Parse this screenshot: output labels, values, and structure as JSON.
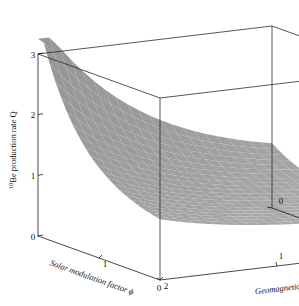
{
  "figure": {
    "type": "3d-surface-plot",
    "background_color": "#ffffff",
    "width": 299,
    "height": 306
  },
  "chart_data": {
    "type": "surface",
    "title": "",
    "projection": "3d",
    "zlabel_parts": {
      "superscript": "10",
      "text": "Be production rate Q"
    },
    "zlabel": "10Be production rate Q",
    "xlabel": "Solar modulation factor ϕ",
    "ylabel": "Geomagnetic field M",
    "xlim": [
      0,
      2
    ],
    "ylim": [
      0,
      2
    ],
    "zlim": [
      0,
      3
    ],
    "xticks": [
      0,
      1,
      2
    ],
    "yticks": [
      0,
      1,
      2
    ],
    "zticks": [
      0,
      1,
      2,
      3
    ],
    "xtick_labels": [
      "0",
      "1",
      "2"
    ],
    "ytick_labels": [
      "0",
      "1",
      "2"
    ],
    "ztick_labels": [
      "0",
      "1",
      "2",
      "3"
    ],
    "xtick_labels_shown": [
      "1",
      "2"
    ],
    "ytick_labels_shown": [
      "0",
      "1",
      "2"
    ],
    "ztick_labels_shown": [
      "0",
      "1",
      "2",
      "3"
    ],
    "grid": false,
    "legend": false,
    "surface_style": {
      "facecolor": "#909090",
      "edgecolor": "#2f2f2f",
      "shading": "flat-gray",
      "mesh_nx": 22,
      "mesh_ny": 22
    },
    "x": [
      0,
      0.0952,
      0.1905,
      0.2857,
      0.381,
      0.4762,
      0.5714,
      0.6667,
      0.7619,
      0.8571,
      0.9524,
      1.0476,
      1.1429,
      1.2381,
      1.3333,
      1.4286,
      1.5238,
      1.619,
      1.7143,
      1.8095,
      1.9048,
      2
    ],
    "y": [
      0,
      0.0952,
      0.1905,
      0.2857,
      0.381,
      0.4762,
      0.5714,
      0.6667,
      0.7619,
      0.8571,
      0.9524,
      1.0476,
      1.1429,
      1.2381,
      1.3333,
      1.4286,
      1.5238,
      1.619,
      1.7143,
      1.8095,
      1.9048,
      2
    ],
    "z_corners": {
      "x0_y0": 3.0,
      "x0_y2": 1.0,
      "x2_y0": 1.35,
      "x2_y2": 0.5
    },
    "z_model": "Q = 0.5 + 2.5 * exp(-1.45*x) * exp(-1.05*y) + 0.35*exp(-1.05*y) + 0.22*exp(-1.45*x)"
  },
  "ticks": {
    "z": [
      {
        "label": "3",
        "value": 3
      },
      {
        "label": "2",
        "value": 2
      },
      {
        "label": "1",
        "value": 1
      },
      {
        "label": "0",
        "value": 0
      }
    ],
    "x": [
      {
        "label": "1",
        "value": 1
      },
      {
        "label": "2",
        "value": 2
      }
    ],
    "y": [
      {
        "label": "2",
        "value": 2
      },
      {
        "label": "1",
        "value": 1
      },
      {
        "label": "0",
        "value": 0
      }
    ]
  }
}
